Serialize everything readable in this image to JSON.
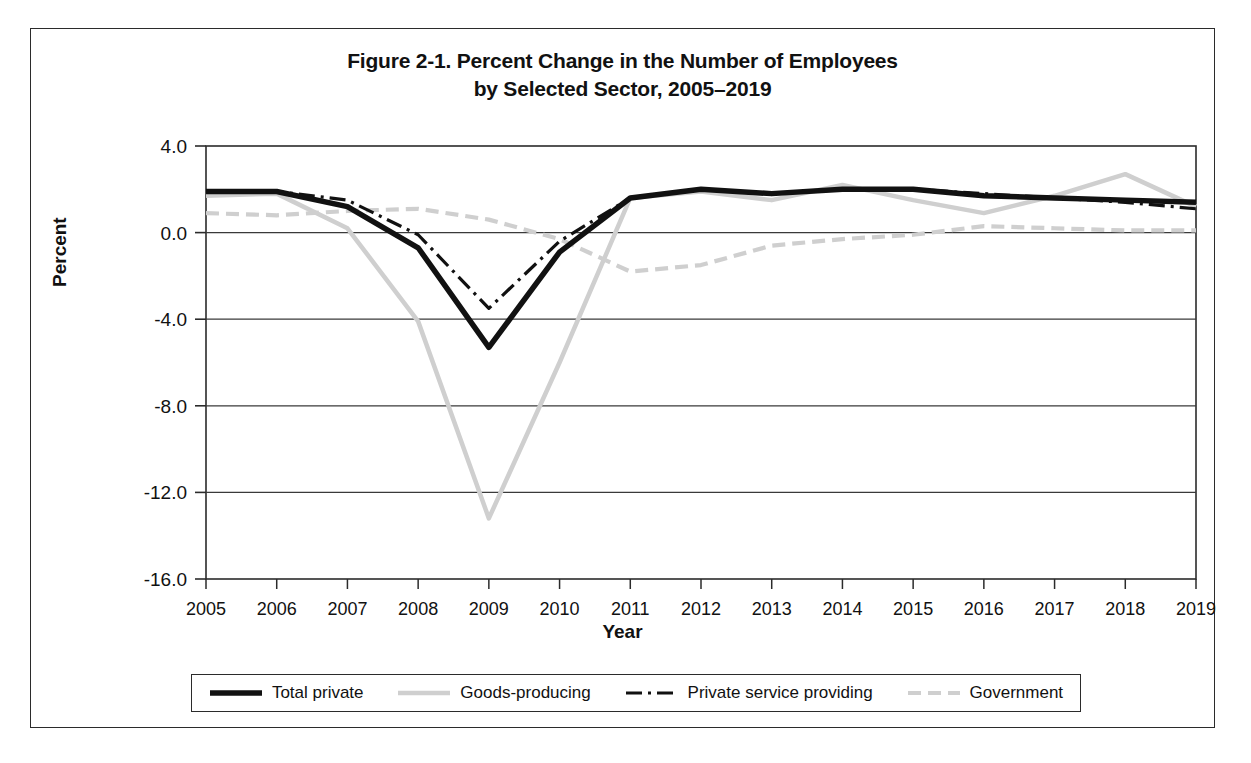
{
  "figure": {
    "title_line1": "Figure 2-1. Percent Change in the Number of Employees",
    "title_line2": "by Selected Sector, 2005–2019"
  },
  "axes": {
    "y_title": "Percent",
    "x_title": "Year"
  },
  "legend": {
    "items": [
      {
        "label": "Total private",
        "style": "solid-thick-black",
        "color": "#111111"
      },
      {
        "label": "Goods-producing",
        "style": "solid-light-gray",
        "color": "#cfcfcf"
      },
      {
        "label": "Private service providing",
        "style": "dash-dot-black",
        "color": "#111111"
      },
      {
        "label": "Government",
        "style": "dashed-light-gray",
        "color": "#cfcfcf"
      }
    ]
  },
  "chart_data": {
    "type": "line",
    "title": "Figure 2-1. Percent Change in the Number of Employees by Selected Sector, 2005–2019",
    "xlabel": "Year",
    "ylabel": "Percent",
    "grid": true,
    "legend_position": "bottom",
    "ylim": [
      -16.0,
      4.0
    ],
    "yticks": [
      "4.0",
      "0.0",
      "-4.0",
      "-8.0",
      "-12.0",
      "-16.0"
    ],
    "ytick_values": [
      4.0,
      0.0,
      -4.0,
      -8.0,
      -12.0,
      -16.0
    ],
    "categories": [
      "2005",
      "2006",
      "2007",
      "2008",
      "2009",
      "2010",
      "2011",
      "2012",
      "2013",
      "2014",
      "2015",
      "2016",
      "2017",
      "2018",
      "2019"
    ],
    "x": [
      2005,
      2006,
      2007,
      2008,
      2009,
      2010,
      2011,
      2012,
      2013,
      2014,
      2015,
      2016,
      2017,
      2018,
      2019
    ],
    "series": [
      {
        "name": "Total private",
        "color": "#111111",
        "style": "solid-thick-black",
        "values": [
          1.9,
          1.9,
          1.2,
          -0.7,
          -5.3,
          -0.9,
          1.6,
          2.0,
          1.8,
          2.0,
          2.0,
          1.7,
          1.6,
          1.5,
          1.4
        ]
      },
      {
        "name": "Goods-producing",
        "color": "#cfcfcf",
        "style": "solid-light-gray",
        "values": [
          1.7,
          1.8,
          0.2,
          -4.1,
          -13.2,
          -6.0,
          1.6,
          1.9,
          1.5,
          2.2,
          1.5,
          0.9,
          1.7,
          2.7,
          1.2
        ]
      },
      {
        "name": "Private service providing",
        "color": "#111111",
        "style": "dash-dot-black",
        "values": [
          1.9,
          1.9,
          1.5,
          -0.1,
          -3.5,
          -0.4,
          1.6,
          2.0,
          1.8,
          2.0,
          2.0,
          1.8,
          1.6,
          1.4,
          1.1
        ]
      },
      {
        "name": "Government",
        "color": "#cfcfcf",
        "style": "dashed-light-gray",
        "values": [
          0.9,
          0.8,
          1.0,
          1.1,
          0.6,
          -0.3,
          -1.8,
          -1.5,
          -0.6,
          -0.3,
          -0.1,
          0.3,
          0.2,
          0.1,
          0.1
        ]
      }
    ]
  }
}
